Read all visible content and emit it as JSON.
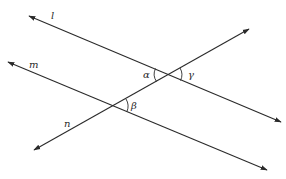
{
  "diagram": {
    "type": "geometry-parallel-lines-transversal",
    "stroke_color": "#2a2a2a",
    "background": "#ffffff",
    "lines": [
      {
        "name": "l",
        "label": "l",
        "x1": 29,
        "y1": 16,
        "x2": 281,
        "y2": 122,
        "arrow_start": true,
        "arrow_end": true,
        "label_x": 51,
        "label_y": 19
      },
      {
        "name": "m",
        "label": "m",
        "x1": 8,
        "y1": 62,
        "x2": 267,
        "y2": 170,
        "arrow_start": true,
        "arrow_end": true,
        "label_x": 29,
        "label_y": 68
      },
      {
        "name": "n",
        "label": "n",
        "x1": 34,
        "y1": 150,
        "x2": 249,
        "y2": 29,
        "arrow_start": true,
        "arrow_end": true,
        "label_x": 64,
        "label_y": 127
      }
    ],
    "intersections": [
      {
        "name": "l-n",
        "x": 168,
        "y": 75
      },
      {
        "name": "m-n",
        "x": 114,
        "y": 106
      }
    ],
    "angles": [
      {
        "name": "alpha",
        "label": "α",
        "vertex": "l-n",
        "arc_path": "M 155.5 68.5 A 13 13 0 0 0 156.5 81.5",
        "label_x": 143,
        "label_y": 78
      },
      {
        "name": "gamma",
        "label": "γ",
        "vertex": "l-n",
        "arc_path": "M 180 68 A 13 13 0 0 1 180.5 80.5",
        "label_x": 188,
        "label_y": 78
      },
      {
        "name": "beta",
        "label": "β",
        "vertex": "m-n",
        "arc_path": "M 126 99 A 14 14 0 0 1 127 111.5",
        "label_x": 131,
        "label_y": 109
      }
    ]
  }
}
